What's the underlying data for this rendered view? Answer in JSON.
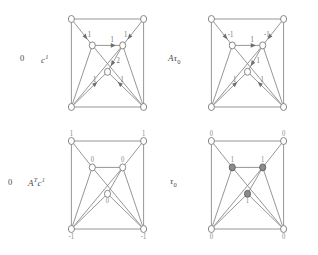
{
  "figure": {
    "title": "",
    "background_color": "#ffffff",
    "edge_color": "#8a8a8a",
    "node_open_fill": "#ffffff",
    "node_filled_fill": "#8c8c8c",
    "label_color": "#4a4a4a"
  },
  "panels": [
    {
      "id": "top-left",
      "name": "flow-c1",
      "label": "c",
      "label_superscript": "1",
      "label_subscript": "",
      "left_zero": "0",
      "kind": "edge-labeled",
      "edge_labels": [
        "1",
        "1",
        "1",
        "2",
        "1",
        "1"
      ],
      "node_labels": [
        "",
        "",
        "",
        "",
        "",
        "",
        ""
      ],
      "node_filled": [
        false,
        false,
        false,
        false,
        false,
        false,
        false
      ]
    },
    {
      "id": "top-right",
      "name": "flow-A-tau0",
      "label": "Aτ",
      "label_superscript": "",
      "label_subscript": "0",
      "left_zero": "",
      "kind": "edge-labeled",
      "edge_labels": [
        "-1",
        "-1",
        "1",
        "1",
        "1",
        "1"
      ],
      "node_labels": [
        "",
        "",
        "",
        "",
        "",
        "",
        ""
      ],
      "node_filled": [
        false,
        false,
        false,
        false,
        false,
        false,
        false
      ]
    },
    {
      "id": "bottom-left",
      "name": "potential-AT-c1",
      "label": "A",
      "label_superscript": "T",
      "label_subscript": "",
      "label_tail": "c",
      "label_tail_superscript": "1",
      "left_zero": "0",
      "kind": "node-labeled",
      "edge_labels": [],
      "node_labels": [
        "1",
        "1",
        "0",
        "0",
        "0",
        "-1",
        "-1"
      ],
      "node_filled": [
        false,
        false,
        false,
        false,
        false,
        false,
        false
      ]
    },
    {
      "id": "bottom-right",
      "name": "potential-tau0",
      "label": "τ",
      "label_superscript": "",
      "label_subscript": "0",
      "left_zero": "",
      "kind": "node-labeled",
      "edge_labels": [],
      "node_labels": [
        "0",
        "0",
        "1",
        "1",
        "1",
        "0",
        "0"
      ],
      "node_filled": [
        false,
        false,
        true,
        true,
        true,
        false,
        false
      ]
    }
  ],
  "nodes": {
    "names": [
      "top-left-corner",
      "top-right-corner",
      "mid-left",
      "mid-right",
      "center",
      "bottom-left-corner",
      "bottom-right-corner"
    ]
  },
  "edges": {
    "names": [
      "top-left-corner-to-mid-left",
      "top-right-corner-to-mid-right",
      "mid-left-to-mid-right",
      "mid-right-to-center",
      "bottom-left-corner-to-center",
      "bottom-right-corner-to-center",
      "top-edge",
      "left-edge",
      "right-edge",
      "bottom-edge",
      "mid-left-to-bottom-right",
      "mid-right-to-bottom-left",
      "mid-left-to-bottom-left",
      "mid-right-to-bottom-right"
    ]
  }
}
